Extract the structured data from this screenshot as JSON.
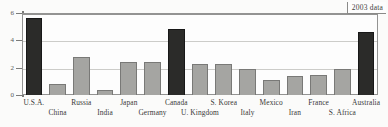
{
  "chart_data": {
    "type": "bar",
    "title": "",
    "subtitle": "",
    "xlabel": "",
    "ylabel": "",
    "ylim": [
      0,
      6
    ],
    "yticks": [
      0,
      2,
      4,
      6
    ],
    "ytick_labels": [
      "0",
      "2",
      "4",
      "6"
    ],
    "grid": true,
    "legend": "none",
    "annotation": "2003 data",
    "categories": [
      "U.S.A.",
      "China",
      "Russia",
      "India",
      "Japan",
      "Germany",
      "Canada",
      "U. Kingdom",
      "S. Korea",
      "Italy",
      "Mexico",
      "Iran",
      "France",
      "S. Africa",
      "Australia"
    ],
    "values": [
      5.6,
      0.8,
      2.8,
      0.4,
      2.4,
      2.4,
      4.8,
      2.3,
      2.3,
      1.9,
      1.1,
      1.4,
      1.5,
      1.9,
      4.6
    ],
    "bar_colors": [
      "black",
      "gray",
      "gray",
      "gray",
      "gray",
      "gray",
      "black",
      "gray",
      "gray",
      "gray",
      "gray",
      "gray",
      "gray",
      "gray",
      "black"
    ],
    "label_rows": [
      0,
      1,
      0,
      1,
      0,
      1,
      0,
      1,
      0,
      1,
      0,
      1,
      0,
      1,
      0
    ],
    "colors": {
      "bar_black": "#161614",
      "bar_gray": "#9d9d9a",
      "bar_gray_edge": "#6d6d6a",
      "gridline": "#c9c9c6",
      "axis": "#6f6f6d",
      "text": "#1f1f1d",
      "background": "#ffffff"
    }
  }
}
